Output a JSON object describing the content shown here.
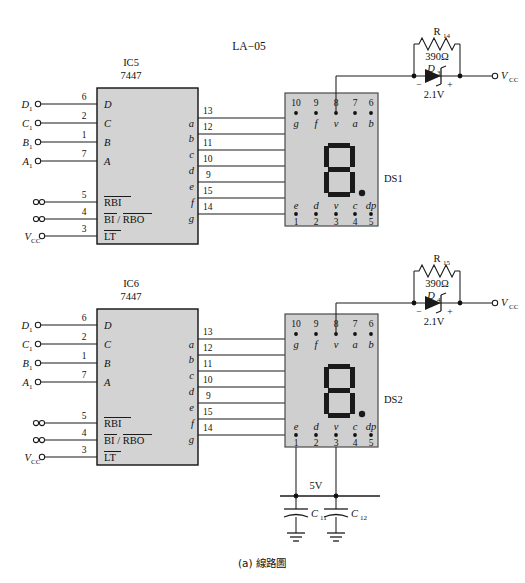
{
  "figure": {
    "title": "LA−05",
    "caption": "(a) 線路圖"
  },
  "stages": [
    {
      "id": "stage-1",
      "ic": {
        "designator": "IC5",
        "part": "7447",
        "inputs": [
          {
            "signal": "D",
            "signal_sub": "1",
            "pin": "6",
            "port": "D",
            "terminal": "open-circle"
          },
          {
            "signal": "C",
            "signal_sub": "1",
            "pin": "2",
            "port": "C",
            "terminal": "open-circle"
          },
          {
            "signal": "B",
            "signal_sub": "1",
            "pin": "1",
            "port": "B",
            "terminal": "open-circle"
          },
          {
            "signal": "A",
            "signal_sub": "1",
            "pin": "7",
            "port": "A",
            "terminal": "open-circle"
          }
        ],
        "controls": [
          {
            "signal": "",
            "pin": "5",
            "port": "RBI",
            "overline": "all",
            "terminal": "double-circle"
          },
          {
            "signal": "",
            "pin": "4",
            "port": "BI / RBO",
            "overline": "split",
            "terminal": "double-circle"
          },
          {
            "signal": "V",
            "signal_sub": "CC",
            "pin": "3",
            "port": "LT",
            "overline": "all",
            "terminal": "open-circle"
          }
        ],
        "outputs": [
          {
            "port": "a",
            "pin": "13"
          },
          {
            "port": "b",
            "pin": "12"
          },
          {
            "port": "c",
            "pin": "11"
          },
          {
            "port": "d",
            "pin": "10"
          },
          {
            "port": "e",
            "pin": "9"
          },
          {
            "port": "f",
            "pin": "15"
          },
          {
            "port": "g",
            "pin": "14"
          }
        ]
      },
      "display": {
        "designator": "DS1",
        "top_pins": [
          "10",
          "9",
          "8",
          "7",
          "6"
        ],
        "top_labels": [
          "g",
          "f",
          "v",
          "a",
          "b"
        ],
        "bottom_labels": [
          "e",
          "d",
          "v",
          "c",
          "dp"
        ],
        "bottom_pins": [
          "1",
          "2",
          "3",
          "4",
          "5"
        ],
        "digit": "8",
        "decimal_point": true
      },
      "supply": {
        "resistor_ref": "R",
        "resistor_sub": "14",
        "resistor_value": "390Ω",
        "diode_ref": "D",
        "diode_sub": "3",
        "diode_value": "2.1V",
        "diode_minus": "−",
        "diode_plus": "+",
        "rail": "V",
        "rail_sub": "CC"
      }
    },
    {
      "id": "stage-2",
      "ic": {
        "designator": "IC6",
        "part": "7447",
        "inputs": [
          {
            "signal": "D",
            "signal_sub": "1",
            "pin": "6",
            "port": "D",
            "terminal": "open-circle"
          },
          {
            "signal": "C",
            "signal_sub": "1",
            "pin": "2",
            "port": "C",
            "terminal": "open-circle"
          },
          {
            "signal": "B",
            "signal_sub": "1",
            "pin": "1",
            "port": "B",
            "terminal": "open-circle"
          },
          {
            "signal": "A",
            "signal_sub": "1",
            "pin": "7",
            "port": "A",
            "terminal": "open-circle"
          }
        ],
        "controls": [
          {
            "signal": "",
            "pin": "5",
            "port": "RBI",
            "overline": "all",
            "terminal": "double-circle"
          },
          {
            "signal": "",
            "pin": "4",
            "port": "BI / RBO",
            "overline": "split",
            "terminal": "double-circle"
          },
          {
            "signal": "V",
            "signal_sub": "CC",
            "pin": "3",
            "port": "LT",
            "overline": "all",
            "terminal": "open-circle"
          }
        ],
        "outputs": [
          {
            "port": "a",
            "pin": "13"
          },
          {
            "port": "b",
            "pin": "12"
          },
          {
            "port": "c",
            "pin": "11"
          },
          {
            "port": "d",
            "pin": "10"
          },
          {
            "port": "e",
            "pin": "9"
          },
          {
            "port": "f",
            "pin": "15"
          },
          {
            "port": "g",
            "pin": "14"
          }
        ]
      },
      "display": {
        "designator": "DS2",
        "top_pins": [
          "10",
          "9",
          "8",
          "7",
          "6"
        ],
        "top_labels": [
          "g",
          "f",
          "v",
          "a",
          "b"
        ],
        "bottom_labels": [
          "e",
          "d",
          "v",
          "c",
          "dp"
        ],
        "bottom_pins": [
          "1",
          "2",
          "3",
          "4",
          "5"
        ],
        "digit": "8",
        "decimal_point": true
      },
      "supply": {
        "resistor_ref": "R",
        "resistor_sub": "15",
        "resistor_value": "390Ω",
        "diode_ref": "D",
        "diode_sub": "4",
        "diode_value": "2.1V",
        "diode_minus": "−",
        "diode_plus": "+",
        "rail": "V",
        "rail_sub": "CC"
      }
    }
  ],
  "power_rail": {
    "label": "5V",
    "caps": [
      {
        "ref": "C",
        "sub": "11"
      },
      {
        "ref": "C",
        "sub": "12"
      }
    ]
  },
  "colors": {
    "page_background": "#ffffff",
    "ic_body": "#d3d3d3",
    "display_body": "#cfcfcf",
    "wire": "#1b1b1b",
    "segment": "#1a1a1a",
    "text": "#111111"
  }
}
